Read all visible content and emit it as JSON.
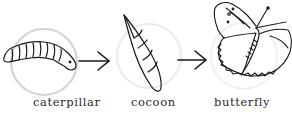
{
  "diagram": {
    "stages": [
      {
        "id": "caterpillar",
        "label": "caterpillar"
      },
      {
        "id": "cocoon",
        "label": "cocoon"
      },
      {
        "id": "butterfly",
        "label": "butterfly"
      }
    ],
    "connectors": [
      {
        "from": "caterpillar",
        "to": "cocoon",
        "icon": "arrow-right-icon"
      },
      {
        "from": "cocoon",
        "to": "butterfly",
        "icon": "arrow-right-icon"
      }
    ],
    "colors": {
      "ink": "#1a1a1a",
      "circle": "#d9d9d9"
    }
  }
}
